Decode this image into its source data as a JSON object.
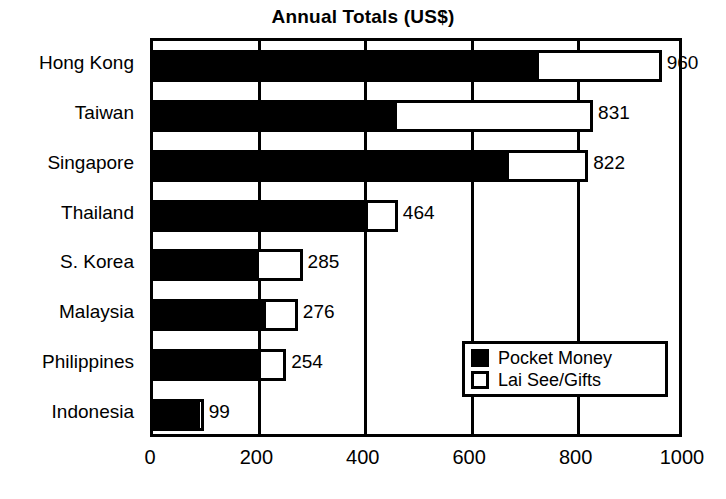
{
  "chart_data": {
    "type": "bar",
    "orientation": "horizontal",
    "stacked": true,
    "title": "Annual Totals (US$)",
    "xlabel": "",
    "ylabel": "",
    "xlim": [
      0,
      1000
    ],
    "xticks": [
      "0",
      "200",
      "400",
      "600",
      "800",
      "1000"
    ],
    "grid": true,
    "legend_position": "bottom-right",
    "categories": [
      "Hong Kong",
      "Taiwan",
      "Singapore",
      "Thailand",
      "S. Korea",
      "Malaysia",
      "Philippines",
      "Indonesia"
    ],
    "totals": [
      960,
      831,
      822,
      464,
      285,
      276,
      254,
      99
    ],
    "data_labels": [
      "960",
      "831",
      "822",
      "464",
      "285",
      "276",
      "254",
      "99"
    ],
    "series": [
      {
        "name": "Pocket Money",
        "color": "#000000",
        "values": [
          724,
          457,
          667,
          402,
          197,
          210,
          201,
          86
        ]
      },
      {
        "name": "Lai See/Gifts",
        "color": "#ffffff",
        "values": [
          236,
          374,
          155,
          62,
          88,
          66,
          53,
          13
        ]
      }
    ]
  },
  "legend": {
    "items": [
      {
        "label": "Pocket Money",
        "swatch": "filled-black-swatch"
      },
      {
        "label": "Lai See/Gifts",
        "swatch": "outline-white-swatch"
      }
    ]
  }
}
